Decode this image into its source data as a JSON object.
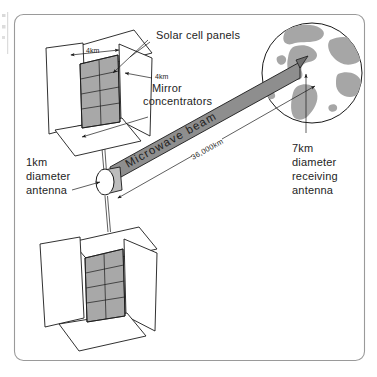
{
  "figure": {
    "frame_color": "#9a9a9a",
    "background": "#ffffff"
  },
  "labels": {
    "solar_cell_panels": "Solar cell panels",
    "mirror_concentrators_line1": "Mirror",
    "mirror_concentrators_line2": "concentrators",
    "panel_width": "4km",
    "panel_height": "4km",
    "antenna_line1": "1km",
    "antenna_line2": "diameter",
    "antenna_line3": "antenna",
    "receiver_line1": "7km",
    "receiver_line2": "diameter",
    "receiver_line3": "receiving",
    "receiver_line4": "antenna",
    "beam": "Microwave beam",
    "distance": "36,000km"
  },
  "colors": {
    "solar_panel_fill": "#a8a8a8",
    "mirror_fill": "#ffffff",
    "beam_fill": "#8e8e8e",
    "land_fill": "#a6a6a6",
    "ocean_fill": "#ffffff",
    "ink": "#1a1a1a",
    "text": "#242424"
  },
  "measurements": {
    "panel_width_km": 4,
    "panel_height_km": 4,
    "transmit_antenna_diameter_km": 1,
    "receive_antenna_diameter_km": 7,
    "orbit_altitude_km": 36000
  },
  "components": {
    "upper_satellite": "solar-power-satellite-upper",
    "lower_satellite": "solar-power-satellite-lower",
    "transmit_antenna": "microwave-transmit-antenna",
    "earth": "earth-globe",
    "beam": "microwave-beam"
  }
}
